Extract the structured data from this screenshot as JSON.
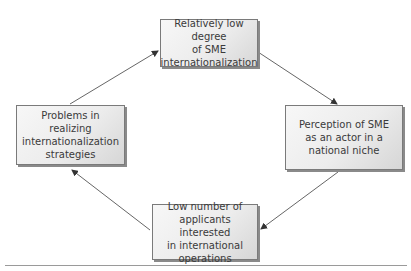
{
  "diagram": {
    "type": "cycle",
    "nodes": [
      {
        "id": "top",
        "label": "Relatively low degree\nof SME\ninternationalization"
      },
      {
        "id": "right",
        "label": "Perception of SME\nas an actor in a\nnational niche"
      },
      {
        "id": "bottom",
        "label": "Low number of\napplicants interested\nin international\noperations"
      },
      {
        "id": "left",
        "label": "Problems in realizing\ninternationalization\nstrategies"
      }
    ],
    "edges": [
      {
        "from": "top",
        "to": "right"
      },
      {
        "from": "right",
        "to": "bottom"
      },
      {
        "from": "bottom",
        "to": "left"
      },
      {
        "from": "left",
        "to": "top"
      }
    ],
    "colors": {
      "box_border": "#7a7a7a",
      "box_fill": "#ececec",
      "text": "#3a3a3a",
      "arrow": "#555555"
    }
  }
}
